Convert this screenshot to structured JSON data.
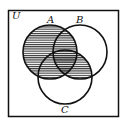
{
  "diagram": {
    "type": "venn",
    "universe_label": "U",
    "sets": [
      {
        "name": "A",
        "label": "A"
      },
      {
        "name": "B",
        "label": "B"
      },
      {
        "name": "C",
        "label": "C"
      }
    ],
    "shaded_region": "A ∪ (B ∩ C)",
    "colors": {
      "stroke": "#111111",
      "hatch": "#222222",
      "background": "#ffffff"
    }
  }
}
